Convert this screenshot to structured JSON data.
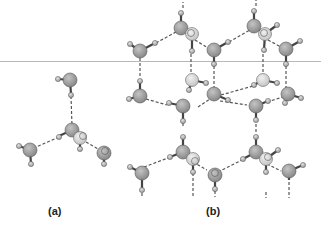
{
  "figure": {
    "panels": [
      {
        "id": "a",
        "label": "(a)",
        "description": "Single water molecule hydrogen-bonded tetrahedrally to four neighbours"
      },
      {
        "id": "b",
        "label": "(b)",
        "description": "Hexagonal ice lattice of hydrogen-bonded water molecules"
      }
    ],
    "colors": {
      "oxygen": "#9a9a9a",
      "oxygen_light": "#d6d6d6",
      "hydrogen": "#b5b5b5",
      "bond": "#444444",
      "hbond": "#555555",
      "divider": "#b8b8b8"
    }
  }
}
